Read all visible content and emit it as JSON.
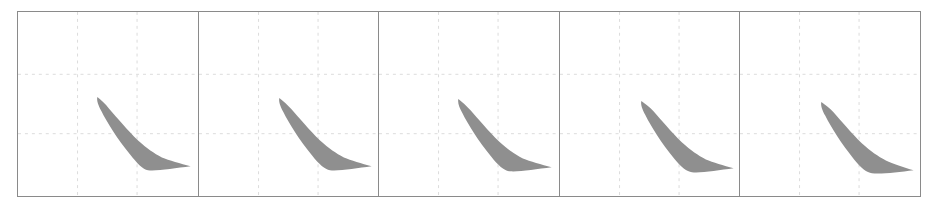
{
  "figure": {
    "panel_count": 5,
    "colors": {
      "border": "#8a8a8a",
      "grid": "#dcdcdc",
      "shape_fill": "#8f8f8f",
      "background": "#ffffff"
    },
    "grid": {
      "vertical_fractions": [
        0.333,
        0.667
      ],
      "horizontal_fractions": [
        0.34,
        0.66
      ],
      "style": "dotted"
    },
    "panels": [
      {
        "id": 1,
        "shape": "crescent-curve",
        "label": ""
      },
      {
        "id": 2,
        "shape": "crescent-curve",
        "label": ""
      },
      {
        "id": 3,
        "shape": "crescent-curve",
        "label": ""
      },
      {
        "id": 4,
        "shape": "crescent-curve",
        "label": ""
      },
      {
        "id": 5,
        "shape": "crescent-curve",
        "label": ""
      }
    ]
  }
}
